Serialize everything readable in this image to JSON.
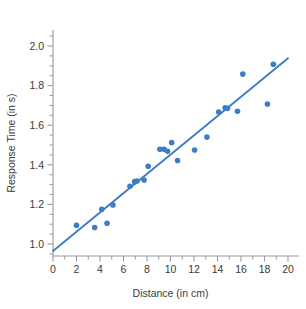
{
  "chart_data": {
    "type": "scatter",
    "title": "",
    "xlabel": "Distance (in cm)",
    "ylabel": "Response Time (in s)",
    "xlim": [
      0,
      20
    ],
    "ylim": [
      0.9,
      2.08
    ],
    "grid": false,
    "legend": "none",
    "xticks": [
      0,
      2,
      4,
      6,
      8,
      10,
      12,
      14,
      16,
      18,
      20
    ],
    "xtick_labels": [
      "0",
      "2",
      "4",
      "6",
      "8",
      "10",
      "12",
      "14",
      "16",
      "18",
      "20"
    ],
    "xminor_ticks": [
      1,
      3,
      5,
      7,
      9,
      11,
      13,
      15,
      17,
      19
    ],
    "yticks": [
      1.0,
      1.2,
      1.4,
      1.6,
      1.8,
      2.0
    ],
    "ytick_labels": [
      "1.0",
      "1.2",
      "1.4",
      "1.6",
      "1.8",
      "2.0"
    ],
    "yminor_ticks": [
      0.95,
      1.05,
      1.1,
      1.15,
      1.25,
      1.3,
      1.35,
      1.45,
      1.5,
      1.55,
      1.65,
      1.7,
      1.75,
      1.85,
      1.9,
      1.95,
      2.05
    ],
    "marker_color": "#3C7DC4",
    "marker_size": 5.6,
    "line_color": "#3C7DC4",
    "line_width": 1.9,
    "points": [
      {
        "x": 2.0,
        "y": 1.095
      },
      {
        "x": 3.55,
        "y": 1.083
      },
      {
        "x": 4.15,
        "y": 1.175
      },
      {
        "x": 4.6,
        "y": 1.105
      },
      {
        "x": 5.1,
        "y": 1.197
      },
      {
        "x": 6.55,
        "y": 1.292
      },
      {
        "x": 6.95,
        "y": 1.315
      },
      {
        "x": 7.15,
        "y": 1.318
      },
      {
        "x": 7.75,
        "y": 1.323
      },
      {
        "x": 8.1,
        "y": 1.393
      },
      {
        "x": 9.1,
        "y": 1.478
      },
      {
        "x": 9.45,
        "y": 1.478
      },
      {
        "x": 9.75,
        "y": 1.468
      },
      {
        "x": 10.1,
        "y": 1.512
      },
      {
        "x": 10.6,
        "y": 1.422
      },
      {
        "x": 12.05,
        "y": 1.475
      },
      {
        "x": 13.1,
        "y": 1.54
      },
      {
        "x": 14.1,
        "y": 1.667
      },
      {
        "x": 14.65,
        "y": 1.688
      },
      {
        "x": 14.85,
        "y": 1.685
      },
      {
        "x": 15.7,
        "y": 1.67
      },
      {
        "x": 16.15,
        "y": 1.858
      },
      {
        "x": 18.25,
        "y": 1.707
      },
      {
        "x": 18.75,
        "y": 1.908
      }
    ],
    "trendline": {
      "x_start": 0.0,
      "y_start": 0.965,
      "x_end": 20.0,
      "y_end": 1.938
    }
  }
}
